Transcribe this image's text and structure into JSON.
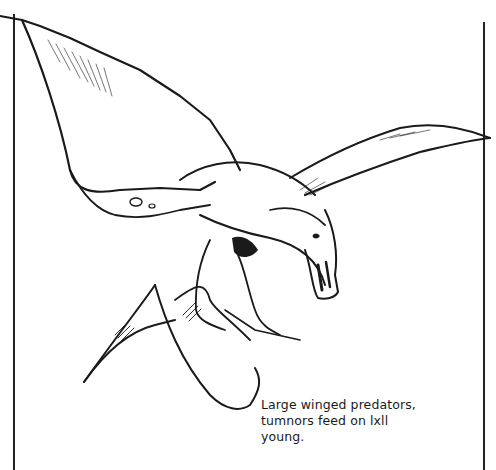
{
  "illustration": {
    "subject": "winged predator creature (tumnor)",
    "style": "black ink line drawing"
  },
  "caption": {
    "lines": [
      "Large winged predators,",
      "tumnors feed on lxll",
      "young."
    ]
  },
  "colors": {
    "ink": "#1a1a1a",
    "paper": "#ffffff"
  }
}
